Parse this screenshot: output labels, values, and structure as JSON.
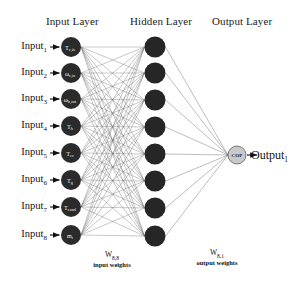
{
  "figure": {
    "type": "neural-network-diagram",
    "background_color": "#ffffff",
    "titles": {
      "input_layer": "Input Layer",
      "hidden_layer": "Hidden Layer",
      "output_layer": "Output Layer"
    }
  },
  "colors": {
    "input_node_fill": "#2b2b2b",
    "hidden_node_fill": "#262626",
    "output_node_fill": "#c9c9c9",
    "output_node_stroke": "#5a5a5a",
    "edge_color": "#6e6e6e",
    "arrow_color": "#111111",
    "text_color": "#141414"
  },
  "input_layer": {
    "title": "Input Layer",
    "count": 8,
    "labels": [
      "Input 1",
      "Input 2",
      "Input 3",
      "Input 4",
      "Input 5",
      "Input 6",
      "Input 7",
      "Input 8"
    ],
    "label_text": [
      "Input",
      "Input",
      "Input",
      "Input",
      "Input",
      "Input",
      "Input",
      "Input"
    ],
    "label_sub": [
      "1",
      "2",
      "3",
      "4",
      "5",
      "6",
      "7",
      "8"
    ],
    "nodes": [
      {
        "symbol": "T",
        "sub": "c,in"
      },
      {
        "symbol": "ω",
        "sub": "c,in"
      },
      {
        "symbol": "ω",
        "sub": "h,out"
      },
      {
        "symbol": "T",
        "sub": "h"
      },
      {
        "symbol": "T",
        "sub": "ev"
      },
      {
        "symbol": "T",
        "sub": "g"
      },
      {
        "symbol": "T",
        "sub": "cond"
      },
      {
        "symbol": "m",
        "sub": "r"
      }
    ]
  },
  "hidden_layer": {
    "title": "Hidden Layer",
    "count": 8,
    "nodes": [
      "h1",
      "h2",
      "h3",
      "h4",
      "h5",
      "h6",
      "h7",
      "h8"
    ]
  },
  "output_layer": {
    "title": "Output Layer",
    "count": 1,
    "node_label": "COP",
    "label_text": "Output",
    "label_sub": "1"
  },
  "weights": {
    "input": {
      "symbol": "W",
      "symbol_sub": "8,8",
      "caption": "input weights"
    },
    "output": {
      "symbol": "W",
      "symbol_sub": "8,1",
      "caption": "output weights"
    }
  },
  "geometry": {
    "input_x": 71,
    "hidden_x": 155,
    "output_x": 237,
    "output_y": 155,
    "input_ys": [
      47,
      73,
      99,
      126,
      153,
      180,
      207,
      235
    ],
    "hidden_ys": [
      47,
      73,
      100,
      127,
      154,
      181,
      208,
      236
    ],
    "input_r": 10,
    "hidden_r": 10.5,
    "output_r": 9
  }
}
